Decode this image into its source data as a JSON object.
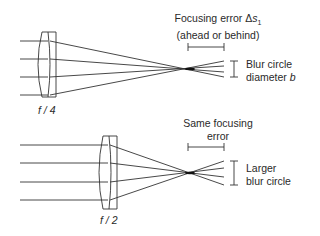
{
  "diagram": {
    "top_panel": {
      "aperture_label": "f / 4",
      "error_label_line1": "Focusing error Δ",
      "error_symbol": "s",
      "error_subscript": "1",
      "error_label_line2": "(ahead or behind)",
      "blur_label_line1": "Blur circle",
      "blur_label_line2": "diameter ",
      "blur_symbol": "b"
    },
    "bottom_panel": {
      "aperture_label": "f / 2",
      "error_label_line1": "Same focusing",
      "error_label_line2": "error",
      "blur_label_line1": "Larger",
      "blur_label_line2": "blur circle"
    },
    "colors": {
      "line": "#333333",
      "text": "#2a2a2a",
      "background": "#ffffff"
    }
  }
}
